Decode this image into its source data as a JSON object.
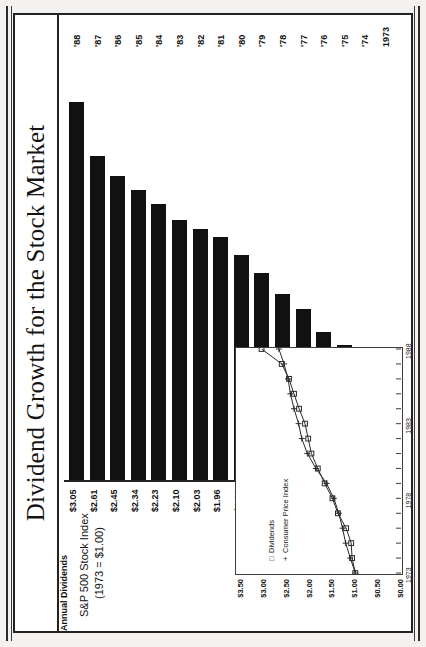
{
  "title": "Dividend Growth for the Stock Market",
  "secondary_axis": {
    "line1": "S&P 500 Stock Index",
    "line2": "(1973 = $1.00)"
  },
  "bar_axis_label": "Annual Dividends",
  "inset": {
    "legend": [
      {
        "marker": "square-marker",
        "symbol": "□",
        "label": "Dividends"
      },
      {
        "marker": "plus-marker",
        "symbol": "+",
        "label": "Consumer Price Index"
      }
    ],
    "y_ticks": [
      "$3.50",
      "$3.00",
      "$2.50",
      "$2.00",
      "$1.50",
      "$1.00",
      "$0.50",
      "$0.00"
    ],
    "x_ticks": [
      "1973",
      "1978",
      "1983",
      "1988"
    ]
  },
  "chart_data": [
    {
      "type": "bar",
      "title": "Dividend Growth for the Stock Market",
      "subtitle": "S&P 500 Stock Index (1973 = $1.00)",
      "orientation": "horizontal",
      "xlabel": "",
      "ylabel": "Annual Dividends",
      "categories": [
        "1973",
        "'74",
        "'75",
        "'76",
        "'77",
        "'78",
        "'79",
        "'80",
        "'81",
        "'82",
        "'83",
        "'84",
        "'85",
        "'86",
        "'87",
        "'88"
      ],
      "values": [
        1.0,
        1.07,
        1.09,
        1.2,
        1.38,
        1.5,
        1.67,
        1.82,
        1.96,
        2.03,
        2.1,
        2.23,
        2.34,
        2.45,
        2.61,
        3.05
      ],
      "data_labels": [
        "$1.00",
        "$1.07",
        "$1.09",
        "$1.20",
        "$1.38",
        "$1.50",
        "$1.67",
        "$1.82",
        "$1.96",
        "$2.03",
        "$2.10",
        "$2.23",
        "$2.34",
        "$2.45",
        "$2.61",
        "$3.05"
      ],
      "xlim": [
        0,
        3.2
      ],
      "grid": false,
      "bar_color": "#111111"
    },
    {
      "type": "line",
      "title": "",
      "xlabel": "",
      "ylabel": "",
      "ylim": [
        0.0,
        3.5
      ],
      "y_ticks": [
        0.0,
        0.5,
        1.0,
        1.5,
        2.0,
        2.5,
        3.0,
        3.5
      ],
      "y_tick_labels": [
        "$0.00",
        "$0.50",
        "$1.00",
        "$1.50",
        "$2.00",
        "$2.50",
        "$3.00",
        "$3.50"
      ],
      "x": [
        "1973",
        "1974",
        "1975",
        "1976",
        "1977",
        "1978",
        "1979",
        "1980",
        "1981",
        "1982",
        "1983",
        "1984",
        "1985",
        "1986",
        "1987",
        "1988"
      ],
      "x_tick_labels": [
        "1973",
        "1978",
        "1983",
        "1988"
      ],
      "grid": false,
      "legend_position": "upper-left",
      "series": [
        {
          "name": "Dividends",
          "marker": "square",
          "values": [
            1.0,
            1.07,
            1.09,
            1.2,
            1.38,
            1.5,
            1.67,
            1.82,
            1.96,
            2.03,
            2.1,
            2.23,
            2.34,
            2.45,
            2.61,
            3.05
          ]
        },
        {
          "name": "Consumer Price Index",
          "marker": "plus",
          "values": [
            1.0,
            1.11,
            1.21,
            1.28,
            1.36,
            1.47,
            1.63,
            1.86,
            2.05,
            2.17,
            2.24,
            2.34,
            2.42,
            2.47,
            2.56,
            2.67
          ]
        }
      ]
    }
  ]
}
